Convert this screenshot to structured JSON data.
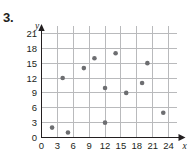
{
  "problem": {
    "number": "3."
  },
  "chart_data": {
    "type": "scatter",
    "title": "",
    "xlabel": "x",
    "ylabel": "y",
    "xlim": [
      0,
      25.5
    ],
    "ylim": [
      0,
      22.5
    ],
    "grid": true,
    "legend": null,
    "xticks": [
      "0",
      "3",
      "6",
      "9",
      "12",
      "15",
      "18",
      "21",
      "24"
    ],
    "xtick_values": [
      0,
      3,
      6,
      9,
      12,
      15,
      18,
      21,
      24
    ],
    "yticks": [
      "0",
      "3",
      "6",
      "9",
      "12",
      "15",
      "18",
      "21"
    ],
    "ytick_values": [
      0,
      3,
      6,
      9,
      12,
      15,
      18,
      21
    ],
    "points": [
      {
        "x": 2,
        "y": 2
      },
      {
        "x": 4,
        "y": 12
      },
      {
        "x": 5,
        "y": 1
      },
      {
        "x": 8,
        "y": 14
      },
      {
        "x": 10,
        "y": 16
      },
      {
        "x": 12,
        "y": 3
      },
      {
        "x": 12,
        "y": 10
      },
      {
        "x": 14,
        "y": 17
      },
      {
        "x": 16,
        "y": 9
      },
      {
        "x": 19,
        "y": 11
      },
      {
        "x": 20,
        "y": 15
      },
      {
        "x": 23,
        "y": 5
      }
    ],
    "marker": {
      "shape": "circle",
      "color": "#6d6e71",
      "size": 4.6
    },
    "colors": {
      "grid": "#b9babc",
      "axis": "#231f20",
      "text": "#231f20",
      "background": "#ffffff"
    }
  }
}
